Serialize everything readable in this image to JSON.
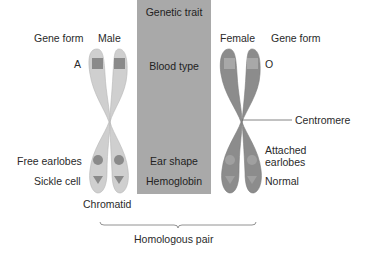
{
  "diagram": {
    "type": "homologous-chromosome-pair",
    "colors": {
      "male_chromosome": "#cfcfcf",
      "female_chromosome": "#8c8c8c",
      "trait_column": "#a9a9a9",
      "marker_male": "#8a8a8a",
      "marker_female": "#a8a8a8"
    },
    "headers": {
      "left_gene_form": "Gene form",
      "male": "Male",
      "female": "Female",
      "right_gene_form": "Gene form"
    },
    "trait_column": {
      "title": "Genetic trait",
      "traits": [
        "Blood type",
        "Ear shape",
        "Hemoglobin"
      ]
    },
    "left_alleles": {
      "blood_type": "A",
      "ear_shape": "Free earlobes",
      "hemoglobin": "Sickle cell"
    },
    "right_alleles": {
      "blood_type": "O",
      "ear_shape_line1": "Attached",
      "ear_shape_line2": "earlobes",
      "hemoglobin": "Normal"
    },
    "callouts": {
      "centromere": "Centromere",
      "chromatid": "Chromatid",
      "homologous_pair": "Homologous pair"
    }
  }
}
